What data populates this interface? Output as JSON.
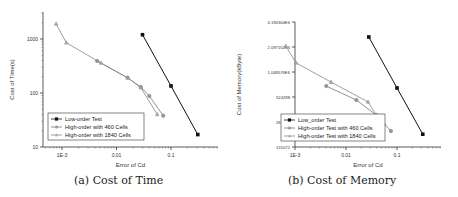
{
  "chart_data": [
    {
      "type": "line",
      "title": "(a) Cost of Time",
      "xlabel": "Error of Cd",
      "ylabel": "Cost of Time(s)",
      "xscale": "log",
      "yscale": "log",
      "xlim": [
        0.0005,
        0.6
      ],
      "ylim": [
        10,
        3000
      ],
      "x_ticks": [
        "1E-3",
        "0.01",
        "0.1"
      ],
      "y_ticks": [
        "10",
        "100",
        "1000"
      ],
      "grid": false,
      "legend_position": "lower left",
      "series": [
        {
          "name": "Low-order Test",
          "marker": "square",
          "color": "#111111",
          "x": [
            0.03,
            0.1,
            0.31
          ],
          "y": [
            1200,
            135,
            17
          ]
        },
        {
          "name": "High-order with 460 Cells",
          "marker": "circle",
          "color": "#777777",
          "x": [
            0.0044,
            0.016,
            0.028,
            0.04,
            0.072
          ],
          "y": [
            392,
            191,
            129,
            88,
            38
          ]
        },
        {
          "name": "High-order with 1840 Cells",
          "marker": "triangle",
          "color": "#888888",
          "x": [
            0.00078,
            0.0012,
            0.0052,
            0.016,
            0.028,
            0.056
          ],
          "y": [
            1900,
            850,
            360,
            191,
            125,
            40
          ]
        }
      ]
    },
    {
      "type": "line",
      "title": "(b) Cost of Memory",
      "xlabel": "Error of Cd",
      "ylabel": "Cost of Memory(kByte)",
      "xscale": "log",
      "yscale": "log2",
      "xlim": [
        0.0005,
        0.6
      ],
      "ylim": [
        131072,
        4194304
      ],
      "x_ticks": [
        "1E-3",
        "0.01",
        "0.1"
      ],
      "y_ticks": [
        "131072",
        "262144",
        "524288",
        "1.048576E6",
        "2.097152E6",
        "4.194304E6"
      ],
      "grid": false,
      "legend_position": "lower left",
      "series": [
        {
          "name": "Low_order Test",
          "marker": "square",
          "color": "#111111",
          "x": [
            0.028,
            0.1,
            0.32
          ],
          "y": [
            2770000,
            673000,
            187000
          ]
        },
        {
          "name": "High-order Test with 460 Cells",
          "marker": "circle",
          "color": "#777777",
          "x": [
            0.0041,
            0.016,
            0.039,
            0.076
          ],
          "y": [
            710000,
            482000,
            318000,
            204000
          ]
        },
        {
          "name": "High-order Test with 1840 Cells",
          "marker": "triangle",
          "color": "#888888",
          "x": [
            0.00066,
            0.00105,
            0.0051,
            0.027,
            0.039,
            0.056
          ],
          "y": [
            2150000,
            1350000,
            792000,
            458000,
            318000,
            248000
          ]
        }
      ]
    }
  ],
  "captions": {
    "a": "(a) Cost of Time",
    "b": "(b) Cost of Memory"
  }
}
